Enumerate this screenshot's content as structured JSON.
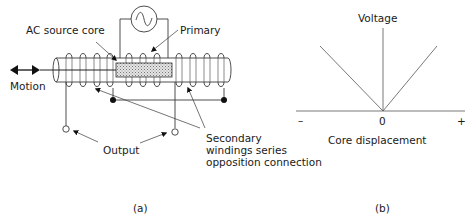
{
  "panel_a": {
    "labels": {
      "ac_source_core": "AC source core",
      "primary": "Primary",
      "motion": "Motion",
      "output": "Output",
      "secondary_line1": "Secondary",
      "secondary_line2": "windings series",
      "secondary_line3": "opposition connection"
    },
    "caption": "(a)",
    "icons": [
      "ac-source-icon",
      "motion-double-arrow-icon"
    ]
  },
  "panel_b": {
    "y_axis_label": "Voltage",
    "x_axis_label": "Core displacement",
    "tick_minus": "–",
    "tick_zero": "0",
    "tick_plus": "+",
    "caption": "(b)"
  },
  "colors": {
    "line": "#3a3a3a",
    "core_fill": "#cfcfcf",
    "text": "#1a1a1a"
  }
}
